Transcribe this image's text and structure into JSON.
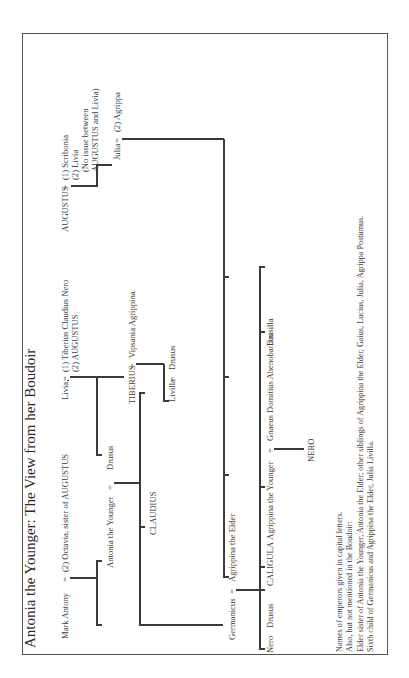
{
  "title": "Antonia the Younger: The View from her Boudoir",
  "people": {
    "mark_antony": "Mark Antony",
    "octavia": "(2) Octavia, sister of AUGUSTUS",
    "livia": "Livia",
    "livia_spouses_1": "(1) Tiberius Claudius Nero",
    "livia_spouses_2": "(2) AUGUSTUS",
    "augustus": "AUGUSTUS",
    "augustus_spouses_1": "(1) Scribonia",
    "augustus_spouses_2": "(2) Livia",
    "augustus_note_1": "(No issue between",
    "augustus_note_2": "AUGUSTUS and Livia)",
    "antonia": "Antonia the Younger",
    "drusus_elder": "Drusus",
    "tiberius": "TIBERIUS",
    "vipsania": "Vipsania Agrippina",
    "julia": "Julia",
    "agrippa": "(2) Agrippa",
    "claudius": "CLAUDIUS",
    "livilla": "Livilla",
    "drusus_younger": "Drusus",
    "germanicus": "Germanicus",
    "agrippina_elder": "Agrippina the Elder",
    "nero_son": "Nero",
    "drusus_son": "Drusus",
    "caligula": "CALIGULA",
    "agrippina_younger": "Agrippina the Younger",
    "gnaeus": "Gnaeus Domitius Ahenobarbus",
    "drusilla": "Drusilla",
    "nero_emperor": "NERO"
  },
  "marriage_symbol": "=",
  "notes": [
    "Names of emperors given in capital letters.",
    "Also, but not mentioned in the Boudoir:",
    "Elder sister of Antonia the Younger, Antonia the Elder; other siblings of Agrippina the Elder, Gaius, Lucius, Julia, Agrippa Postumus.",
    "Sixth child of Germanicus and Agrippina the Elder, Julia Livilla."
  ]
}
